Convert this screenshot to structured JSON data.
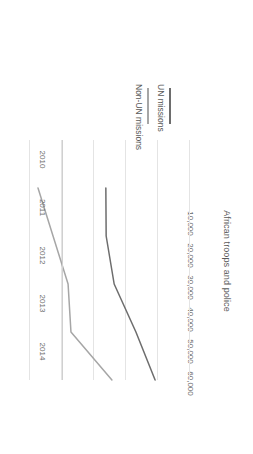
{
  "chart_data": {
    "type": "line",
    "title": "",
    "xlabel": "",
    "ylabel": "African troops and police",
    "categories": [
      "2010",
      "2011",
      "2012",
      "2013",
      "2014"
    ],
    "x_tick_labels": [
      "2010",
      "2011",
      "2012",
      "2013",
      "2014"
    ],
    "y_tick_labels": [
      "10,000",
      "20,000",
      "30,000",
      "40,000",
      "50,000",
      "60,000"
    ],
    "y_ticks": [
      10000,
      20000,
      30000,
      40000,
      50000,
      60000
    ],
    "ylim": [
      0,
      60000
    ],
    "grid": true,
    "grid_orientation": "value-axis",
    "legend_position": "below-plot",
    "rotation": "180deg",
    "series": [
      {
        "name": "UN missions",
        "color": "#6d6d6d",
        "values": [
          33700,
          33800,
          36300,
          43100,
          49100
        ]
      },
      {
        "name": "Non-UN missions",
        "color": "#a6a6a6",
        "values": [
          12500,
          17200,
          21900,
          22800,
          35600
        ]
      }
    ]
  },
  "legend": {
    "entries": [
      {
        "label": "UN missions",
        "color": "#6d6d6d"
      },
      {
        "label": "Non-UN missions",
        "color": "#a6a6a6"
      }
    ]
  },
  "axes": {
    "y_title": "African troops and police",
    "y_labels": [
      "60,000",
      "50,000",
      "40,000",
      "30,000",
      "20,000",
      "10,000"
    ],
    "x_labels": [
      "2010",
      "2011",
      "2012",
      "2013",
      "2014"
    ]
  },
  "colors": {
    "gridline": "#e4e4e4",
    "axis": "#d0d0d0",
    "text": "#595959",
    "series_un": "#6d6d6d",
    "series_non_un": "#a6a6a6"
  }
}
